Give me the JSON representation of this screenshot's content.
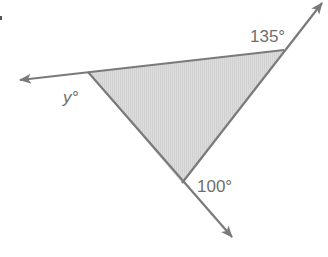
{
  "diagram": {
    "type": "triangle-exterior-angles",
    "colors": {
      "line": "#7a7a7a",
      "fill": "#d9d9d9",
      "text": "#6e6e6e"
    },
    "labels": {
      "top_right_angle": "135°",
      "left_angle": "y°",
      "bottom_angle": "100°"
    },
    "angles": [
      {
        "name": "top_right_exterior",
        "value": 135,
        "unit": "degrees"
      },
      {
        "name": "left_exterior",
        "value": "y",
        "unit": "degrees"
      },
      {
        "name": "bottom_exterior",
        "value": 100,
        "unit": "degrees"
      }
    ]
  }
}
